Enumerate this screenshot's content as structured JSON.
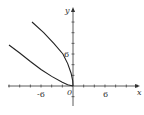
{
  "chart_data": {
    "type": "line",
    "title": "",
    "xlabel": "x",
    "ylabel": "y",
    "xlim": [
      -13,
      12
    ],
    "ylim": [
      -3,
      14
    ],
    "x_tick_step": 2,
    "y_tick_step": 2,
    "x_tick_labels": [
      "-6",
      "0",
      "6"
    ],
    "y_tick_labels": [
      "6"
    ],
    "origin_label": "0",
    "grid": false,
    "legend": null,
    "series": [
      {
        "name": "upper curve",
        "points": [
          [
            -7.7,
            12
          ],
          [
            -5.5,
            10
          ],
          [
            -3.6,
            8
          ],
          [
            -1.9,
            6
          ],
          [
            -1.0,
            4.2
          ],
          [
            -0.35,
            2.4
          ],
          [
            -0.05,
            1
          ],
          [
            0,
            0
          ]
        ]
      },
      {
        "name": "lower curve",
        "points": [
          [
            -12,
            7.7
          ],
          [
            -10,
            6.2
          ],
          [
            -8,
            4.6
          ],
          [
            -6,
            3.1
          ],
          [
            -4,
            1.8
          ],
          [
            -2,
            0.7
          ],
          [
            -1,
            0.25
          ],
          [
            0,
            0
          ]
        ]
      }
    ]
  },
  "labels": {
    "x_axis": "x",
    "y_axis": "y",
    "x_neg": "-6",
    "x_pos": "6",
    "y_pos": "6",
    "origin": "0"
  }
}
